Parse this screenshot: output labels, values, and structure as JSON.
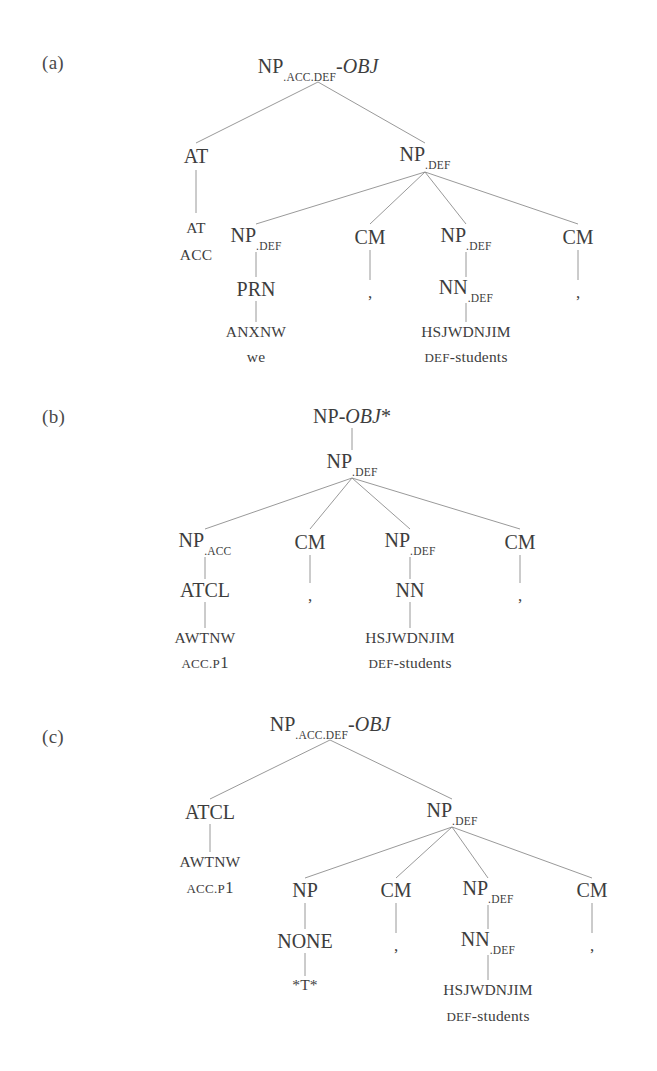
{
  "figure": {
    "background_color": "#ffffff",
    "line_color": "#8d8d8d",
    "text_color": "#3d3d3d"
  },
  "panels": [
    {
      "id": "a",
      "label": "(a)",
      "nodes": [
        {
          "name": "root",
          "x": 318,
          "y": 68,
          "text": "NP",
          "sub": ".ACC.DEF",
          "italic": "-OBJ",
          "cls": "node"
        },
        {
          "name": "at-phrase",
          "x": 196,
          "y": 156,
          "text": "AT",
          "cls": "node"
        },
        {
          "name": "at-terminal",
          "x": 196,
          "y": 228,
          "text": "AT",
          "cls": "node terminal"
        },
        {
          "name": "at-gloss",
          "x": 196,
          "y": 255,
          "text": "ACC",
          "cls": "node gloss sc-line"
        },
        {
          "name": "np-def-parent",
          "x": 425,
          "y": 156,
          "text": "NP",
          "sub": ".DEF",
          "cls": "node"
        },
        {
          "name": "np-def-child",
          "x": 256,
          "y": 237,
          "text": "NP",
          "sub": ".DEF",
          "cls": "node"
        },
        {
          "name": "cm-1",
          "x": 370,
          "y": 237,
          "text": "CM",
          "cls": "node"
        },
        {
          "name": "np-def-child-2",
          "x": 466,
          "y": 237,
          "text": "NP",
          "sub": ".DEF",
          "cls": "node"
        },
        {
          "name": "cm-2",
          "x": 578,
          "y": 237,
          "text": "CM",
          "cls": "node"
        },
        {
          "name": "prn",
          "x": 256,
          "y": 289,
          "text": "PRN",
          "cls": "node"
        },
        {
          "name": "comma-1",
          "x": 370,
          "y": 292,
          "text": ",",
          "cls": "node punct"
        },
        {
          "name": "nn-def",
          "x": 466,
          "y": 289,
          "text": "NN",
          "sub": ".DEF",
          "cls": "node"
        },
        {
          "name": "comma-2",
          "x": 578,
          "y": 292,
          "text": ",",
          "cls": "node punct"
        },
        {
          "name": "anxnw-terminal",
          "x": 256,
          "y": 332,
          "text": "ANXNW",
          "cls": "node terminal"
        },
        {
          "name": "anxnw-gloss",
          "x": 256,
          "y": 357,
          "text": "we",
          "cls": "node gloss lc-line"
        },
        {
          "name": "hsjwdnjim-terminal",
          "x": 466,
          "y": 332,
          "text": "HSJWDNJIM",
          "cls": "node terminal"
        },
        {
          "name": "hsjwdnjim-gloss",
          "x": 466,
          "y": 357,
          "sc": "DEF",
          "lc": "-students",
          "cls": "node gloss"
        }
      ],
      "edges": [
        {
          "name": "edge-root-at",
          "x1": 318,
          "y1": 82,
          "x2": 196,
          "y2": 143
        },
        {
          "name": "edge-root-npdef",
          "x1": 318,
          "y1": 82,
          "x2": 425,
          "y2": 143
        },
        {
          "name": "edge-at-atterm",
          "x1": 196,
          "y1": 170,
          "x2": 196,
          "y2": 213
        },
        {
          "name": "edge-npdef-c1",
          "x1": 425,
          "y1": 172,
          "x2": 256,
          "y2": 224
        },
        {
          "name": "edge-npdef-c2",
          "x1": 425,
          "y1": 172,
          "x2": 370,
          "y2": 224
        },
        {
          "name": "edge-npdef-c3",
          "x1": 425,
          "y1": 172,
          "x2": 466,
          "y2": 224
        },
        {
          "name": "edge-npdef-c4",
          "x1": 425,
          "y1": 172,
          "x2": 578,
          "y2": 224
        },
        {
          "name": "edge-np-prn",
          "x1": 256,
          "y1": 252,
          "x2": 256,
          "y2": 277
        },
        {
          "name": "edge-cm1-comma",
          "x1": 370,
          "y1": 250,
          "x2": 370,
          "y2": 280
        },
        {
          "name": "edge-np2-nn",
          "x1": 466,
          "y1": 252,
          "x2": 466,
          "y2": 277
        },
        {
          "name": "edge-cm2-comma",
          "x1": 578,
          "y1": 250,
          "x2": 578,
          "y2": 280
        },
        {
          "name": "edge-prn-anxnw",
          "x1": 256,
          "y1": 301,
          "x2": 256,
          "y2": 322
        },
        {
          "name": "edge-nn-hsjwdnjim",
          "x1": 466,
          "y1": 303,
          "x2": 466,
          "y2": 322
        }
      ]
    },
    {
      "id": "b",
      "label": "(b)",
      "nodes": [
        {
          "name": "root",
          "x": 352,
          "y": 36,
          "text": "NP-",
          "italic": "OBJ",
          "after": "*",
          "cls": "node"
        },
        {
          "name": "np-def-parent",
          "x": 352,
          "y": 83,
          "text": "NP",
          "sub": ".DEF",
          "cls": "node"
        },
        {
          "name": "np-acc",
          "x": 205,
          "y": 162,
          "text": "NP",
          "sub": ".ACC",
          "cls": "node"
        },
        {
          "name": "cm-1",
          "x": 310,
          "y": 162,
          "text": "CM",
          "cls": "node"
        },
        {
          "name": "np-def-child",
          "x": 410,
          "y": 162,
          "text": "NP",
          "sub": ".DEF",
          "cls": "node"
        },
        {
          "name": "cm-2",
          "x": 520,
          "y": 162,
          "text": "CM",
          "cls": "node"
        },
        {
          "name": "atcl",
          "x": 205,
          "y": 210,
          "text": "ATCL",
          "cls": "node"
        },
        {
          "name": "comma-1",
          "x": 310,
          "y": 215,
          "text": ",",
          "cls": "node punct"
        },
        {
          "name": "nn",
          "x": 410,
          "y": 210,
          "text": "NN",
          "cls": "node"
        },
        {
          "name": "comma-2",
          "x": 520,
          "y": 215,
          "text": ",",
          "cls": "node punct"
        },
        {
          "name": "awtnw-terminal",
          "x": 205,
          "y": 258,
          "text": "AWTNW",
          "cls": "node terminal"
        },
        {
          "name": "awtnw-gloss",
          "x": 205,
          "y": 283,
          "sc": "ACC.P",
          "dg": "1",
          "cls": "node gloss"
        },
        {
          "name": "hsjwdnjim-terminal",
          "x": 410,
          "y": 258,
          "text": "HSJWDNJIM",
          "cls": "node terminal"
        },
        {
          "name": "hsjwdnjim-gloss",
          "x": 410,
          "y": 283,
          "sc": "DEF",
          "lc": "-students",
          "cls": "node gloss"
        }
      ],
      "edges": [
        {
          "name": "edge-root-npdef",
          "x1": 352,
          "y1": 48,
          "x2": 352,
          "y2": 70
        },
        {
          "name": "edge-npdef-c1",
          "x1": 352,
          "y1": 98,
          "x2": 205,
          "y2": 149
        },
        {
          "name": "edge-npdef-c2",
          "x1": 352,
          "y1": 98,
          "x2": 310,
          "y2": 149
        },
        {
          "name": "edge-npdef-c3",
          "x1": 352,
          "y1": 98,
          "x2": 410,
          "y2": 149
        },
        {
          "name": "edge-npdef-c4",
          "x1": 352,
          "y1": 98,
          "x2": 520,
          "y2": 149
        },
        {
          "name": "edge-npacc-atcl",
          "x1": 205,
          "y1": 177,
          "x2": 205,
          "y2": 199
        },
        {
          "name": "edge-cm1-comma",
          "x1": 310,
          "y1": 175,
          "x2": 310,
          "y2": 203
        },
        {
          "name": "edge-npdef-nn",
          "x1": 410,
          "y1": 177,
          "x2": 410,
          "y2": 199
        },
        {
          "name": "edge-cm2-comma",
          "x1": 520,
          "y1": 175,
          "x2": 520,
          "y2": 203
        },
        {
          "name": "edge-atcl-awtnw",
          "x1": 205,
          "y1": 222,
          "x2": 205,
          "y2": 248
        },
        {
          "name": "edge-nn-hsjwdnjim",
          "x1": 410,
          "y1": 222,
          "x2": 410,
          "y2": 248
        }
      ]
    },
    {
      "id": "c",
      "label": "(c)",
      "nodes": [
        {
          "name": "root",
          "x": 330,
          "y": 26,
          "text": "NP",
          "sub": ".ACC.DEF",
          "italic": "-OBJ",
          "cls": "node"
        },
        {
          "name": "atcl",
          "x": 210,
          "y": 112,
          "text": "ATCL",
          "cls": "node"
        },
        {
          "name": "awtnw-terminal",
          "x": 210,
          "y": 162,
          "text": "AWTNW",
          "cls": "node terminal"
        },
        {
          "name": "awtnw-gloss",
          "x": 210,
          "y": 188,
          "sc": "ACC.P",
          "dg": "1",
          "cls": "node gloss"
        },
        {
          "name": "np-def-parent",
          "x": 452,
          "y": 112,
          "text": "NP",
          "sub": ".DEF",
          "cls": "node"
        },
        {
          "name": "np",
          "x": 305,
          "y": 190,
          "text": "NP",
          "cls": "node"
        },
        {
          "name": "cm-1",
          "x": 396,
          "y": 190,
          "text": "CM",
          "cls": "node"
        },
        {
          "name": "np-def-child",
          "x": 488,
          "y": 190,
          "text": "NP",
          "sub": ".DEF",
          "cls": "node"
        },
        {
          "name": "cm-2",
          "x": 592,
          "y": 190,
          "text": "CM",
          "cls": "node"
        },
        {
          "name": "none",
          "x": 305,
          "y": 241,
          "text": "NONE",
          "cls": "node"
        },
        {
          "name": "comma-1",
          "x": 396,
          "y": 245,
          "text": ",",
          "cls": "node punct"
        },
        {
          "name": "nn-def",
          "x": 488,
          "y": 241,
          "text": "NN",
          "sub": ".DEF",
          "cls": "node"
        },
        {
          "name": "comma-2",
          "x": 592,
          "y": 245,
          "text": ",",
          "cls": "node punct"
        },
        {
          "name": "trace",
          "x": 305,
          "y": 285,
          "text": "*T*",
          "cls": "node terminal"
        },
        {
          "name": "hsjwdnjim-terminal",
          "x": 488,
          "y": 290,
          "text": "HSJWDNJIM",
          "cls": "node terminal"
        },
        {
          "name": "hsjwdnjim-gloss",
          "x": 488,
          "y": 316,
          "sc": "DEF",
          "lc": "-students",
          "cls": "node gloss"
        }
      ],
      "edges": [
        {
          "name": "edge-root-atcl",
          "x1": 330,
          "y1": 40,
          "x2": 210,
          "y2": 99
        },
        {
          "name": "edge-root-npdef",
          "x1": 330,
          "y1": 40,
          "x2": 452,
          "y2": 99
        },
        {
          "name": "edge-atcl-awtnw",
          "x1": 210,
          "y1": 124,
          "x2": 210,
          "y2": 152
        },
        {
          "name": "edge-npdef-c1",
          "x1": 452,
          "y1": 127,
          "x2": 305,
          "y2": 178
        },
        {
          "name": "edge-npdef-c2",
          "x1": 452,
          "y1": 127,
          "x2": 396,
          "y2": 178
        },
        {
          "name": "edge-npdef-c3",
          "x1": 452,
          "y1": 127,
          "x2": 488,
          "y2": 178
        },
        {
          "name": "edge-npdef-c4",
          "x1": 452,
          "y1": 127,
          "x2": 592,
          "y2": 178
        },
        {
          "name": "edge-np-none",
          "x1": 305,
          "y1": 203,
          "x2": 305,
          "y2": 229
        },
        {
          "name": "edge-cm1-comma",
          "x1": 396,
          "y1": 203,
          "x2": 396,
          "y2": 233
        },
        {
          "name": "edge-npdef-nn",
          "x1": 488,
          "y1": 205,
          "x2": 488,
          "y2": 229
        },
        {
          "name": "edge-cm2-comma",
          "x1": 592,
          "y1": 203,
          "x2": 592,
          "y2": 233
        },
        {
          "name": "edge-none-trace",
          "x1": 305,
          "y1": 253,
          "x2": 305,
          "y2": 276
        },
        {
          "name": "edge-nn-hsjwd",
          "x1": 488,
          "y1": 255,
          "x2": 488,
          "y2": 280
        }
      ]
    }
  ]
}
